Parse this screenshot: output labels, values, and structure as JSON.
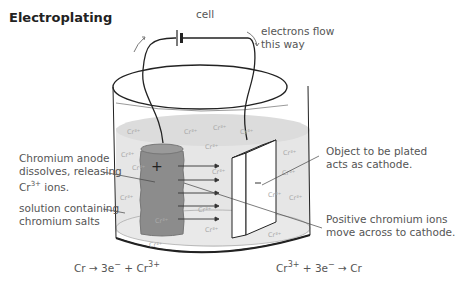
{
  "title": "Electroplating",
  "labels": {
    "cell": "cell",
    "electron_flow_line1": "electrons flow",
    "electron_flow_line2": "this way",
    "anode_line1": "Chromium anode",
    "anode_line2": "dissolves, releasing",
    "anode_line3_pre": "Cr",
    "anode_line3_sup": "3+",
    "anode_line3_post": " ions.",
    "solution_line1": "solution containing",
    "solution_line2": "chromium salts",
    "cathode_line1": "Object to be plated",
    "cathode_line2": "acts as cathode.",
    "ions_line1": "Positive chromium ions",
    "ions_line2": "move across to cathode.",
    "anode_sign": "+",
    "cathode_sign": "−"
  },
  "equations": {
    "anode": {
      "pre": "Cr → 3e",
      "sup1": "−",
      "mid": " + Cr",
      "sup2": "3+"
    },
    "cathode": {
      "pre": "Cr",
      "sup1": "3+",
      "mid": " + 3e",
      "sup2": "−",
      "post": " → Cr"
    }
  },
  "ion_label": "Cr3+",
  "colors": {
    "solution": "#e4e4e4",
    "anode": "#888888",
    "outline": "#222222",
    "text": "#555555"
  }
}
